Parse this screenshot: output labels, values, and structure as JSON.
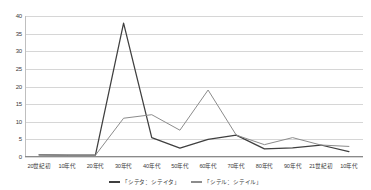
{
  "chart_data": {
    "type": "line",
    "title": "",
    "xlabel": "",
    "ylabel": "",
    "ylim": [
      0,
      40
    ],
    "ytick_values": [
      40,
      35,
      30,
      25,
      20,
      15,
      10,
      5,
      0
    ],
    "grid": "horizontal",
    "legend_position": "bottom",
    "categories": [
      "20世紀初",
      "10年代",
      "20年代",
      "30年代",
      "40年代",
      "50年代",
      "60年代",
      "70年代",
      "80年代",
      "90年代",
      "21世紀初",
      "10年代"
    ],
    "series": [
      {
        "name": "「シテタ：シテイタ」",
        "color": "#3f3f3f",
        "values": [
          0.6,
          0.5,
          0.5,
          38,
          5.5,
          2.5,
          5,
          6.2,
          2.3,
          2.6,
          3.4,
          1.5
        ]
      },
      {
        "name": "「シテル：シテイル」",
        "color": "#8c8c8c",
        "values": [
          0.6,
          0.5,
          0.5,
          11,
          12,
          7.6,
          19,
          6.2,
          3.5,
          5.5,
          3.4,
          3
        ]
      }
    ]
  },
  "legend": {
    "items": [
      {
        "label": "「シテタ：シテイタ」",
        "color": "#3f3f3f"
      },
      {
        "label": "「シテル：シテイル」",
        "color": "#8c8c8c"
      }
    ]
  }
}
